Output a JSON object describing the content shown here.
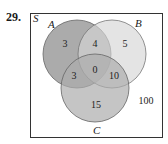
{
  "problem": {
    "number": "29."
  },
  "diagram": {
    "universe_label": "S",
    "sets": [
      {
        "name": "A",
        "color": "#9c9c9c"
      },
      {
        "name": "B",
        "color": "#d6d6d6"
      },
      {
        "name": "C",
        "color": "#adadad"
      }
    ],
    "regions": {
      "A_only": "3",
      "A_and_B_only": "4",
      "B_only": "5",
      "A_and_B_and_C": "0",
      "A_and_C_only": "3",
      "B_and_C_only": "10",
      "C_only": "15",
      "outside": "100"
    }
  }
}
